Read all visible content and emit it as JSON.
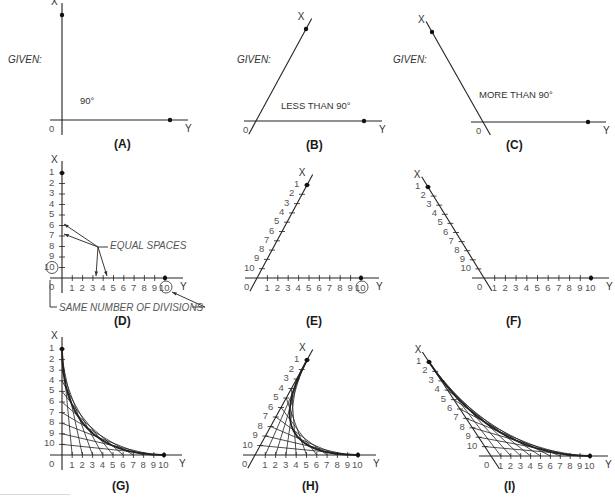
{
  "figure": {
    "colors": {
      "line": "#222222",
      "text": "#333333",
      "tick_label": "#555555",
      "note": "#555555"
    }
  },
  "panels": [
    {
      "id": "A",
      "caption": "(A)",
      "given_label": "GIVEN:",
      "angle_label": "90°",
      "x_label": "X",
      "y_label": "Y",
      "origin_label": "0",
      "origin": [
        62,
        120
      ],
      "x_end": [
        62,
        15
      ],
      "y_end": [
        170,
        120
      ]
    },
    {
      "id": "B",
      "caption": "(B)",
      "given_label": "GIVEN:",
      "angle_label": "LESS THAN 90°",
      "x_label": "X",
      "y_label": "Y",
      "origin_label": "0",
      "origin": [
        256,
        121
      ],
      "x_end": [
        306,
        29
      ],
      "y_end": [
        364,
        121
      ]
    },
    {
      "id": "C",
      "caption": "(C)",
      "given_label": "GIVEN:",
      "angle_label": "MORE THAN 90°",
      "x_label": "X",
      "y_label": "Y",
      "origin_label": "0",
      "origin": [
        483,
        122
      ],
      "x_end": [
        432,
        32
      ],
      "y_end": [
        588,
        122
      ]
    },
    {
      "id": "D",
      "caption": "(D)",
      "x_label": "X",
      "y_label": "Y",
      "origin_label": "0",
      "origin": [
        62,
        278
      ],
      "x_end": [
        62,
        173
      ],
      "y_end": [
        165,
        278
      ],
      "divisions": 10,
      "x_tick_labels": [
        "1",
        "2",
        "3",
        "4",
        "5",
        "6",
        "7",
        "8",
        "9",
        "10"
      ],
      "y_tick_labels": [
        "1",
        "2",
        "3",
        "4",
        "5",
        "6",
        "7",
        "8",
        "9",
        "10"
      ],
      "circled": [
        "x10",
        "y10"
      ],
      "annotations": {
        "equal_spaces": "EQUAL SPACES",
        "same_divisions": "SAME NUMBER OF DIVISIONS"
      }
    },
    {
      "id": "E",
      "caption": "(E)",
      "x_label": "X",
      "y_label": "Y",
      "origin_label": "0",
      "origin": [
        257,
        278
      ],
      "x_end": [
        307,
        185
      ],
      "y_end": [
        361,
        278
      ],
      "divisions": 10,
      "x_tick_labels": [
        "1",
        "2",
        "3",
        "4",
        "5",
        "6",
        "7",
        "8",
        "9",
        "10"
      ],
      "y_tick_labels": [
        "1",
        "2",
        "3",
        "4",
        "5",
        "6",
        "7",
        "8",
        "9",
        "10"
      ],
      "circled": [
        "y10"
      ]
    },
    {
      "id": "F",
      "caption": "(F)",
      "x_label": "X",
      "y_label": "Y",
      "origin_label": "0",
      "origin": [
        484,
        278
      ],
      "x_end": [
        428,
        187
      ],
      "y_end": [
        591,
        278
      ],
      "divisions": 10,
      "x_tick_labels": [
        "1",
        "2",
        "3",
        "4",
        "5",
        "6",
        "7",
        "8",
        "9",
        "10"
      ],
      "y_tick_labels": [
        "1",
        "2",
        "3",
        "4",
        "5",
        "6",
        "7",
        "8",
        "9",
        "10"
      ],
      "circled": []
    },
    {
      "id": "G",
      "caption": "(G)",
      "x_label": "X",
      "y_label": "Y",
      "origin_label": "0",
      "origin": [
        62,
        455
      ],
      "x_end": [
        62,
        349
      ],
      "y_end": [
        164,
        455
      ],
      "divisions": 10,
      "curve": true,
      "x_tick_labels": [
        "1",
        "2",
        "3",
        "4",
        "5",
        "6",
        "7",
        "8",
        "9",
        "10"
      ],
      "y_tick_labels": [
        "1",
        "2",
        "3",
        "4",
        "5",
        "6",
        "7",
        "8",
        "9",
        "10"
      ],
      "circled": []
    },
    {
      "id": "H",
      "caption": "(H)",
      "x_label": "X",
      "y_label": "Y",
      "origin_label": "0",
      "origin": [
        255,
        455
      ],
      "x_end": [
        307,
        360
      ],
      "y_end": [
        358,
        455
      ],
      "divisions": 10,
      "curve": true,
      "x_tick_labels": [
        "1",
        "2",
        "3",
        "4",
        "5",
        "6",
        "7",
        "8",
        "9",
        "10"
      ],
      "y_tick_labels": [
        "1",
        "2",
        "3",
        "4",
        "5",
        "6",
        "7",
        "8",
        "9",
        "10"
      ],
      "circled": []
    },
    {
      "id": "I",
      "caption": "(I)",
      "x_label": "X",
      "y_label": "Y",
      "origin_label": "0",
      "origin": [
        491,
        456
      ],
      "x_end": [
        429,
        362
      ],
      "y_end": [
        590,
        456
      ],
      "divisions": 10,
      "curve": true,
      "x_tick_labels": [
        "1",
        "2",
        "3",
        "4",
        "5",
        "6",
        "7",
        "8",
        "9",
        "10"
      ],
      "y_tick_labels": [
        "1",
        "2",
        "3",
        "4",
        "5",
        "6",
        "7",
        "8",
        "9",
        "10"
      ],
      "circled": []
    }
  ],
  "captions": {
    "A": "(A)",
    "B": "(B)",
    "C": "(C)",
    "D": "(D)",
    "E": "(E)",
    "F": "(F)",
    "G": "(G)",
    "H": "(H)",
    "I": "(I)"
  },
  "given": {
    "A": "GIVEN:",
    "B": "GIVEN:",
    "C": "GIVEN:"
  },
  "angles": {
    "A": "90°",
    "B": "LESS THAN 90°",
    "C": "MORE THAN 90°"
  },
  "notes": {
    "equal_spaces": "EQUAL SPACES",
    "same_divisions": "SAME NUMBER OF DIVISIONS"
  }
}
